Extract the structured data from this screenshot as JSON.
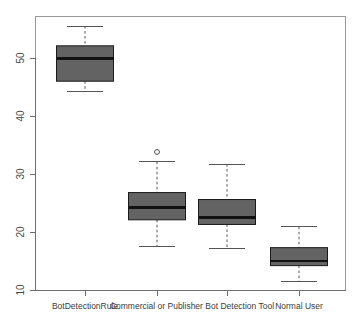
{
  "chart_data": {
    "type": "boxplot",
    "title": "",
    "xlabel": "",
    "ylabel": "",
    "grid": false,
    "legend": false,
    "ylim": [
      10,
      56
    ],
    "yticks": [
      10,
      20,
      30,
      40,
      50
    ],
    "ytick_labels": [
      "10",
      "20",
      "30",
      "40",
      "50"
    ],
    "categories": [
      "BotDetectionRule",
      "Commercial or Publisher Bot Detection Tool",
      "Normal User"
    ],
    "xtick_count": 4,
    "boxes": [
      {
        "name": "BotDetectionRule",
        "center": 1,
        "whisker_low": 44.3,
        "q1": 46.0,
        "median": 49.9,
        "q3": 52.1,
        "whisker_high": 55.5,
        "outliers": []
      },
      {
        "name": "Commercial Tool A",
        "center": 2,
        "whisker_low": 17.5,
        "q1": 22.1,
        "median": 24.2,
        "q3": 26.8,
        "whisker_high": 32.1,
        "outliers": [
          33.8
        ]
      },
      {
        "name": "Publisher Bot Detection Tool",
        "center": 3,
        "whisker_low": 17.1,
        "q1": 21.3,
        "median": 22.5,
        "q3": 25.6,
        "whisker_high": 31.7,
        "outliers": []
      },
      {
        "name": "Normal User",
        "center": 4,
        "whisker_low": 11.4,
        "q1": 14.2,
        "median": 15.0,
        "q3": 17.3,
        "whisker_high": 20.9,
        "outliers": []
      }
    ],
    "colors": {
      "box_fill": "#636363",
      "box_stroke": "#1a1a1a",
      "median": "#111111",
      "whisker": "#555555",
      "axis": "#6e6e6e",
      "frame": "#9a9a9a",
      "background": "#ffffff"
    }
  },
  "axis": {
    "y_tick_labels": [
      "50",
      "40",
      "30",
      "20",
      "10"
    ],
    "x_category_labels": [
      "BotDetectionRule",
      "Commercial or Publisher Bot Detection Tool",
      "Normal User"
    ]
  }
}
